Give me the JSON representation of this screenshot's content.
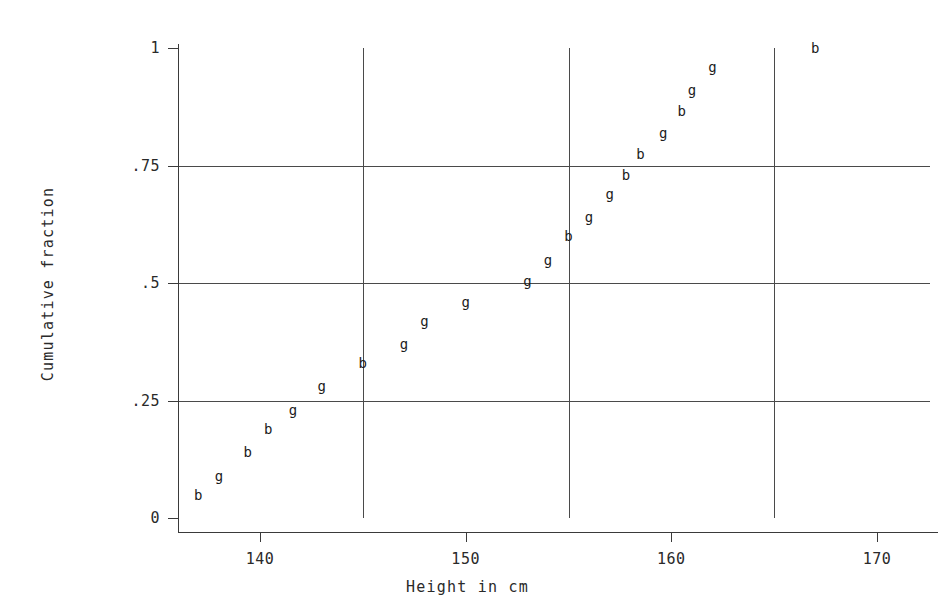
{
  "chart_data": {
    "type": "scatter",
    "title": "",
    "xlabel": "Height in cm",
    "ylabel": "Cumulative fraction",
    "xlim": [
      136,
      171.5
    ],
    "ylim": [
      0,
      1.04
    ],
    "xticks": [
      "140",
      "150",
      "160",
      "170"
    ],
    "xtick_values": [
      140,
      150,
      160,
      170
    ],
    "yticks": [
      "0",
      ".25",
      ".5",
      ".75",
      "1"
    ],
    "ytick_values": [
      0,
      0.25,
      0.5,
      0.75,
      1
    ],
    "grid": "both",
    "grid_x_values": [
      145,
      155,
      165
    ],
    "grid_y_values": [
      0.25,
      0.5,
      0.75
    ],
    "legend": "none",
    "marker_style": "text-letter",
    "series": [
      {
        "name": "b",
        "label": "b",
        "marker": "b",
        "x": [
          137.0,
          139.4,
          140.4,
          145.0,
          155.0,
          157.8,
          158.5,
          160.5,
          167.0
        ],
        "y": [
          0.05,
          0.14,
          0.19,
          0.33,
          0.6,
          0.73,
          0.775,
          0.865,
          1.0
        ]
      },
      {
        "name": "g",
        "label": "g",
        "marker": "g",
        "x": [
          138.0,
          141.6,
          143.0,
          147.0,
          148.0,
          150.0,
          153.0,
          154.0,
          156.0,
          157.0,
          159.6,
          161.0,
          162.0
        ],
        "y": [
          0.09,
          0.23,
          0.28,
          0.37,
          0.42,
          0.46,
          0.505,
          0.55,
          0.64,
          0.69,
          0.82,
          0.91,
          0.96
        ]
      }
    ],
    "points": [
      {
        "label": "b",
        "x": 137.0,
        "y": 0.05
      },
      {
        "label": "g",
        "x": 138.0,
        "y": 0.09
      },
      {
        "label": "b",
        "x": 139.4,
        "y": 0.14
      },
      {
        "label": "b",
        "x": 140.4,
        "y": 0.19
      },
      {
        "label": "g",
        "x": 141.6,
        "y": 0.23
      },
      {
        "label": "g",
        "x": 143.0,
        "y": 0.28
      },
      {
        "label": "b",
        "x": 145.0,
        "y": 0.33
      },
      {
        "label": "g",
        "x": 147.0,
        "y": 0.37
      },
      {
        "label": "g",
        "x": 148.0,
        "y": 0.42
      },
      {
        "label": "g",
        "x": 150.0,
        "y": 0.46
      },
      {
        "label": "g",
        "x": 153.0,
        "y": 0.505
      },
      {
        "label": "g",
        "x": 154.0,
        "y": 0.55
      },
      {
        "label": "b",
        "x": 155.0,
        "y": 0.6
      },
      {
        "label": "g",
        "x": 156.0,
        "y": 0.64
      },
      {
        "label": "g",
        "x": 157.0,
        "y": 0.69
      },
      {
        "label": "b",
        "x": 157.8,
        "y": 0.73
      },
      {
        "label": "b",
        "x": 158.5,
        "y": 0.775
      },
      {
        "label": "g",
        "x": 159.6,
        "y": 0.82
      },
      {
        "label": "b",
        "x": 160.5,
        "y": 0.865
      },
      {
        "label": "g",
        "x": 161.0,
        "y": 0.91
      },
      {
        "label": "g",
        "x": 162.0,
        "y": 0.96
      },
      {
        "label": "b",
        "x": 167.0,
        "y": 1.0
      }
    ]
  },
  "axes": {
    "x_title": "Height in cm",
    "y_title": "Cumulative fraction",
    "x_tick_labels": [
      "140",
      "150",
      "160",
      "170"
    ],
    "y_tick_labels": [
      "0",
      ".25",
      ".5",
      ".75",
      "1"
    ]
  },
  "colors": {
    "axis": "#3a3a3a",
    "grid": "#4a4a4a",
    "point": "#1c1c1c",
    "background": "#ffffff"
  }
}
